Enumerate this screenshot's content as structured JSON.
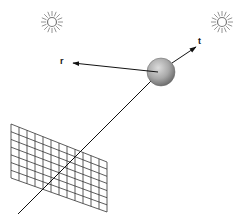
{
  "diagram": {
    "labels": {
      "reflected": "r",
      "transmitted": "t"
    },
    "lights": [
      {
        "name": "light-source-left",
        "x": 52,
        "y": 22
      },
      {
        "name": "light-source-right",
        "x": 222,
        "y": 22
      }
    ],
    "sphere": {
      "cx": 161,
      "cy": 72,
      "r": 14,
      "color_light": "#d8d8d8",
      "color_dark": "#7a7a7a"
    },
    "image_plane": {
      "columns": 12,
      "rows": 7,
      "color": "#333333"
    },
    "colors": {
      "line": "#111111",
      "sun": "#777777",
      "background": "#ffffff"
    }
  }
}
